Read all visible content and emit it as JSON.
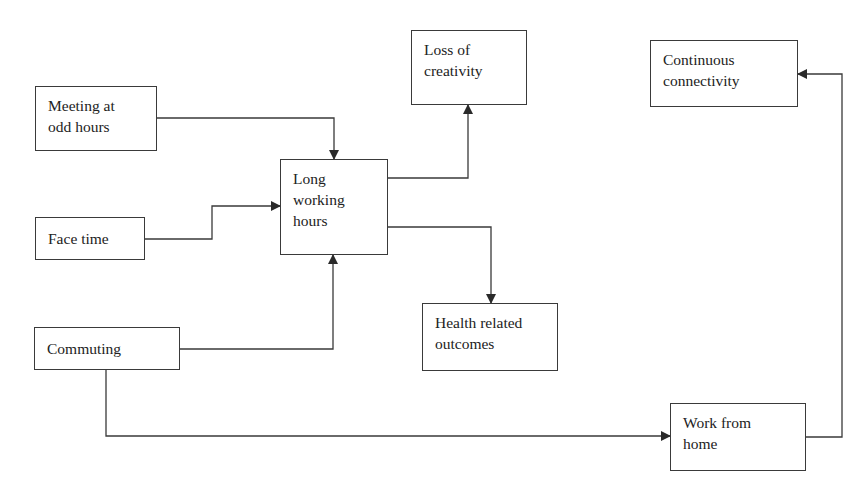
{
  "diagram": {
    "type": "flowchart",
    "nodes": [
      {
        "id": "meeting",
        "lines": [
          "Meeting at",
          "odd hours"
        ]
      },
      {
        "id": "facetime",
        "lines": [
          "Face time"
        ]
      },
      {
        "id": "commuting",
        "lines": [
          "Commuting"
        ]
      },
      {
        "id": "long_hours",
        "lines": [
          "Long",
          "working",
          "hours"
        ]
      },
      {
        "id": "loss_creativity",
        "lines": [
          "Loss of",
          "creativity"
        ]
      },
      {
        "id": "health",
        "lines": [
          "Health related",
          "outcomes"
        ]
      },
      {
        "id": "connectivity",
        "lines": [
          "Continuous",
          "connectivity"
        ]
      },
      {
        "id": "wfh",
        "lines": [
          "Work from",
          "home"
        ]
      }
    ],
    "edges": [
      {
        "from": "meeting",
        "to": "long_hours"
      },
      {
        "from": "facetime",
        "to": "long_hours"
      },
      {
        "from": "commuting",
        "to": "long_hours"
      },
      {
        "from": "long_hours",
        "to": "loss_creativity"
      },
      {
        "from": "long_hours",
        "to": "health"
      },
      {
        "from": "commuting",
        "to": "wfh"
      },
      {
        "from": "wfh",
        "to": "connectivity"
      }
    ],
    "colors": {
      "line": "#3a3a3a",
      "text": "#222222",
      "background": "#ffffff"
    }
  }
}
